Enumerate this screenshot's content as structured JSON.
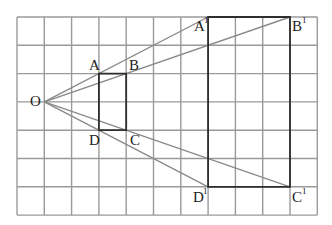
{
  "diagram": {
    "type": "homothety-grid",
    "grid": {
      "origin_x": 17,
      "origin_y": 17,
      "cols": 11,
      "rows": 7,
      "cell_w": 27.3,
      "cell_h": 28.3,
      "line_color": "#9a9a9a"
    },
    "center": {
      "name": "O",
      "col": 1,
      "row": 3
    },
    "small_rect": {
      "points": [
        {
          "name": "A",
          "col": 3,
          "row": 2
        },
        {
          "name": "B",
          "col": 4,
          "row": 2
        },
        {
          "name": "C",
          "col": 4,
          "row": 4
        },
        {
          "name": "D",
          "col": 3,
          "row": 4
        }
      ]
    },
    "large_rect": {
      "points": [
        {
          "name": "A",
          "sup": "1",
          "col": 7,
          "row": 0
        },
        {
          "name": "B",
          "sup": "1",
          "col": 10,
          "row": 0
        },
        {
          "name": "C",
          "sup": "1",
          "col": 10,
          "row": 6
        },
        {
          "name": "D",
          "sup": "1",
          "col": 7,
          "row": 6
        }
      ]
    },
    "labels": {
      "O": "O",
      "A": "A",
      "B": "B",
      "C": "C",
      "D": "D",
      "A1": "A",
      "B1": "B",
      "C1": "C",
      "D1": "D",
      "prime": "1"
    },
    "colors": {
      "ray": "#8a8a8a",
      "rect": "#2e2e2e",
      "text": "#222222"
    }
  }
}
